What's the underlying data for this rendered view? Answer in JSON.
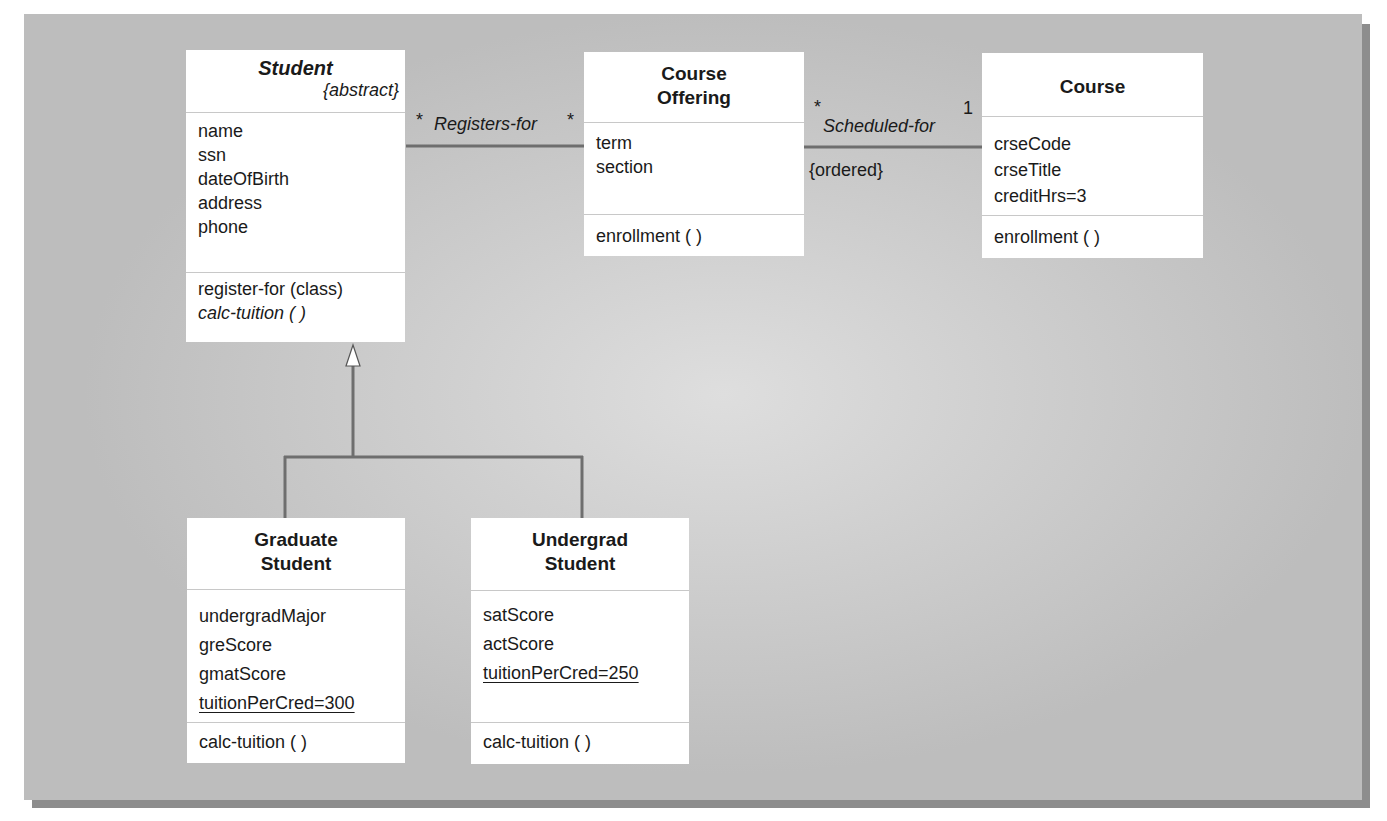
{
  "diagram": {
    "type": "UML class diagram",
    "classes": {
      "student": {
        "name": "Student",
        "stereotype": "{abstract}",
        "attributes": [
          "name",
          "ssn",
          "dateOfBirth",
          "address",
          "phone"
        ],
        "operations": [
          "register-for (class)",
          "calc-tuition ( )"
        ]
      },
      "course_offering": {
        "name_line1": "Course",
        "name_line2": "Offering",
        "attributes": [
          "term",
          "section"
        ],
        "operations": [
          "enrollment ( )"
        ]
      },
      "course": {
        "name": "Course",
        "attributes": [
          "crseCode",
          "crseTitle",
          "creditHrs=3"
        ],
        "operations": [
          "enrollment ( )"
        ]
      },
      "graduate_student": {
        "name_line1": "Graduate",
        "name_line2": "Student",
        "attributes": [
          "undergradMajor",
          "greScore",
          "gmatScore",
          "tuitionPerCred=300"
        ],
        "operations": [
          "calc-tuition ( )"
        ]
      },
      "undergrad_student": {
        "name_line1": "Undergrad",
        "name_line2": "Student",
        "attributes": [
          "satScore",
          "actScore",
          "tuitionPerCred=250"
        ],
        "operations": [
          "calc-tuition ( )"
        ]
      }
    },
    "associations": {
      "registers_for": {
        "name": "Registers-for",
        "from_multiplicity": "*",
        "to_multiplicity": "*"
      },
      "scheduled_for": {
        "name": "Scheduled-for",
        "from_multiplicity": "*",
        "to_multiplicity": "1",
        "constraint": "{ordered}"
      }
    },
    "colors": {
      "panel": "#c8c8c8",
      "line": "#6e6e6e",
      "box": "#ffffff",
      "divider": "#c8c8c8"
    }
  }
}
